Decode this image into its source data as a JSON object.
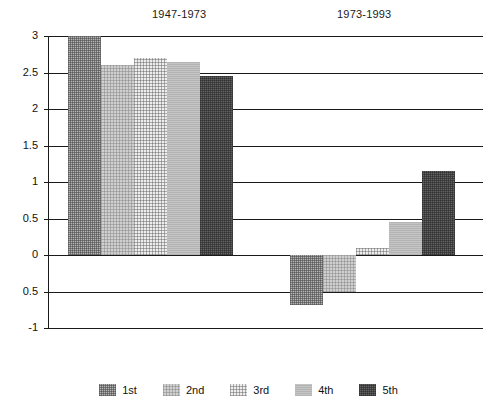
{
  "chart_data": {
    "type": "bar",
    "title": "",
    "subtitle": "",
    "xlabel": "",
    "ylabel": "",
    "ylim": [
      -1,
      3
    ],
    "grid": true,
    "legend_position": "bottom",
    "categories": [
      "1947-1973",
      "1973-1993"
    ],
    "series": [
      {
        "name": "1st",
        "values": [
          3.0,
          -0.68
        ]
      },
      {
        "name": "2nd",
        "values": [
          2.6,
          -0.5
        ]
      },
      {
        "name": "3rd",
        "values": [
          2.7,
          0.1
        ]
      },
      {
        "name": "4th",
        "values": [
          2.65,
          0.45
        ]
      },
      {
        "name": "5th",
        "values": [
          2.45,
          1.15
        ]
      }
    ],
    "ytick_values": [
      3,
      2.5,
      2,
      1.5,
      1,
      0.5,
      0,
      -0.5,
      -1
    ],
    "ytick_labels": [
      "3",
      "2.5",
      "2",
      "1.5",
      "1",
      "0.5",
      "0",
      "0.5",
      "-1"
    ],
    "colors": {
      "1st": "#b4b4b4",
      "2nd": "#cfcfcf",
      "3rd": "#ededed",
      "4th": "#c4c4c4",
      "5th": "#636363",
      "axis": "#1a1a1a",
      "background": "#ffffff"
    }
  },
  "groups": [
    {
      "label": "1947-1973"
    },
    {
      "label": "1973-1993"
    }
  ],
  "legend": {
    "items": [
      {
        "label": "1st"
      },
      {
        "label": "2nd"
      },
      {
        "label": "3rd"
      },
      {
        "label": "4th"
      },
      {
        "label": "5th"
      }
    ]
  },
  "axis": {
    "ticks": [
      {
        "label": "3"
      },
      {
        "label": "2.5"
      },
      {
        "label": "2"
      },
      {
        "label": "1.5"
      },
      {
        "label": "1"
      },
      {
        "label": "0.5"
      },
      {
        "label": "0"
      },
      {
        "label": "0.5"
      },
      {
        "label": "-1"
      }
    ]
  }
}
